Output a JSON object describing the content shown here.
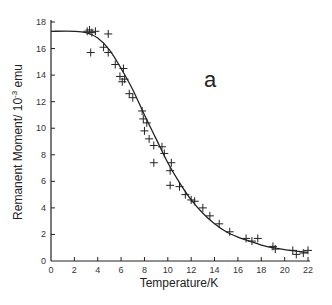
{
  "chart_data": {
    "type": "scatter",
    "title": "",
    "panel_label": "a",
    "xlabel": "Temperature/K",
    "ylabel": "Remanent Moment/ 10",
    "ylabel_exp": "-3",
    "ylabel_unit": " emu",
    "xlim": [
      0,
      22
    ],
    "ylim": [
      0,
      18
    ],
    "xticks": [
      0,
      2,
      4,
      6,
      8,
      10,
      12,
      14,
      16,
      18,
      20,
      22
    ],
    "yticks": [
      0,
      2,
      4,
      6,
      8,
      10,
      12,
      14,
      16,
      18
    ],
    "grid": false,
    "legend": "none",
    "series": [
      {
        "name": "measured",
        "marker": "+",
        "points": [
          [
            3.1,
            17.3
          ],
          [
            3.3,
            17.4
          ],
          [
            3.5,
            17.2
          ],
          [
            3.8,
            17.3
          ],
          [
            4.9,
            17.1
          ],
          [
            3.4,
            15.7
          ],
          [
            4.5,
            16.1
          ],
          [
            4.9,
            15.7
          ],
          [
            5.5,
            14.8
          ],
          [
            6.2,
            14.5
          ],
          [
            5.9,
            13.9
          ],
          [
            6.3,
            13.7
          ],
          [
            6.1,
            13.5
          ],
          [
            6.7,
            12.6
          ],
          [
            7.0,
            12.3
          ],
          [
            7.8,
            11.3
          ],
          [
            7.9,
            10.7
          ],
          [
            8.2,
            10.4
          ],
          [
            8.0,
            9.8
          ],
          [
            8.4,
            9.2
          ],
          [
            8.8,
            8.7
          ],
          [
            8.8,
            7.4
          ],
          [
            9.5,
            8.6
          ],
          [
            9.7,
            8.1
          ],
          [
            10.3,
            7.4
          ],
          [
            10.2,
            6.8
          ],
          [
            10.2,
            5.7
          ],
          [
            11.0,
            5.6
          ],
          [
            11.5,
            5.0
          ],
          [
            12.0,
            4.6
          ],
          [
            12.3,
            4.5
          ],
          [
            13.0,
            4.0
          ],
          [
            13.6,
            3.4
          ],
          [
            14.4,
            2.8
          ],
          [
            15.3,
            2.2
          ],
          [
            16.7,
            1.7
          ],
          [
            17.2,
            1.5
          ],
          [
            17.7,
            1.7
          ],
          [
            19.0,
            1.1
          ],
          [
            19.2,
            0.9
          ],
          [
            20.7,
            0.8
          ],
          [
            21.0,
            0.5
          ],
          [
            21.6,
            0.6
          ],
          [
            22.0,
            0.8
          ]
        ]
      },
      {
        "name": "fit",
        "style": "line",
        "points": [
          [
            0,
            17.3
          ],
          [
            2,
            17.3
          ],
          [
            3,
            17.2
          ],
          [
            4,
            16.8
          ],
          [
            5,
            15.9
          ],
          [
            6,
            14.5
          ],
          [
            7,
            12.9
          ],
          [
            8,
            11.0
          ],
          [
            9,
            9.2
          ],
          [
            10,
            7.4
          ],
          [
            11,
            5.9
          ],
          [
            12,
            4.6
          ],
          [
            13,
            3.6
          ],
          [
            14,
            2.8
          ],
          [
            15,
            2.2
          ],
          [
            16,
            1.8
          ],
          [
            17,
            1.5
          ],
          [
            18,
            1.2
          ],
          [
            19,
            1.0
          ],
          [
            20,
            0.85
          ],
          [
            21,
            0.75
          ],
          [
            22,
            0.65
          ]
        ]
      }
    ]
  }
}
